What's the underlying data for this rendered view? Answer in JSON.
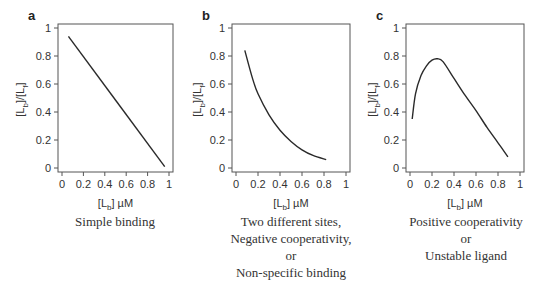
{
  "chart_data": [
    {
      "panel": "a",
      "type": "line",
      "title": "",
      "caption": [
        "Simple binding"
      ],
      "xlabel": "[Lb] µM",
      "ylabel": "[Lb]/[Lf]",
      "xlim": [
        0,
        1
      ],
      "ylim": [
        0,
        1
      ],
      "xticks": [
        "0",
        "0.2",
        "0.4",
        "0.6",
        "0.8",
        "1"
      ],
      "yticks": [
        "0",
        "0.2",
        "0.4",
        "0.6",
        "0.8",
        "1"
      ],
      "grid": false,
      "series": [
        {
          "name": "Simple binding",
          "x": [
            0.06,
            0.96
          ],
          "y": [
            0.94,
            0.01
          ]
        }
      ]
    },
    {
      "panel": "b",
      "type": "line",
      "title": "",
      "caption": [
        "Two different sites,",
        "Negative cooperativity,",
        "or",
        "Non-specific binding"
      ],
      "xlabel": "[Lb] µM",
      "ylabel": "[Lb]/[Lf]",
      "xlim": [
        0,
        1
      ],
      "ylim": [
        0,
        1
      ],
      "xticks": [
        "0",
        "0.2",
        "0.4",
        "0.6",
        "0.8",
        "1"
      ],
      "yticks": [
        "0",
        "0.2",
        "0.4",
        "0.6",
        "0.8",
        "1"
      ],
      "grid": false,
      "series": [
        {
          "name": "Negative cooperativity",
          "x": [
            0.08,
            0.15,
            0.2,
            0.3,
            0.4,
            0.5,
            0.6,
            0.7,
            0.82
          ],
          "y": [
            0.84,
            0.64,
            0.53,
            0.38,
            0.27,
            0.19,
            0.13,
            0.09,
            0.06
          ]
        }
      ]
    },
    {
      "panel": "c",
      "type": "line",
      "title": "",
      "caption": [
        "Positive cooperativity",
        "or",
        "Unstable ligand"
      ],
      "xlabel": "[Lb] µM",
      "ylabel": "[Lb]/[Lf]",
      "xlim": [
        0,
        1
      ],
      "ylim": [
        0,
        1
      ],
      "xticks": [
        "0",
        "0.2",
        "0.4",
        "0.6",
        "0.8",
        "1"
      ],
      "yticks": [
        "0",
        "0.2",
        "0.4",
        "0.6",
        "0.8",
        "1"
      ],
      "grid": false,
      "series": [
        {
          "name": "Positive cooperativity",
          "x": [
            0.02,
            0.05,
            0.1,
            0.15,
            0.2,
            0.25,
            0.3,
            0.4,
            0.5,
            0.6,
            0.7,
            0.8,
            0.89
          ],
          "y": [
            0.35,
            0.53,
            0.66,
            0.73,
            0.77,
            0.78,
            0.76,
            0.64,
            0.52,
            0.41,
            0.29,
            0.18,
            0.08
          ]
        }
      ]
    }
  ],
  "panels": [
    {
      "letter": "a",
      "xlabel_main": "[L",
      "xlabel_sub": "b",
      "xlabel_unit": "] µM",
      "ylabel_a": "[L",
      "ylabel_sub1": "b",
      "ylabel_b": "]/[L",
      "ylabel_sub2": "f",
      "ylabel_c": "]",
      "caption": [
        "Simple binding"
      ]
    },
    {
      "letter": "b",
      "xlabel_main": "[L",
      "xlabel_sub": "b",
      "xlabel_unit": "] µM",
      "ylabel_a": "[L",
      "ylabel_sub1": "b",
      "ylabel_b": "]/[L",
      "ylabel_sub2": "f",
      "ylabel_c": "]",
      "caption": [
        "Two different sites,",
        "Negative cooperativity,",
        "or",
        "Non-specific binding"
      ]
    },
    {
      "letter": "c",
      "xlabel_main": "[L",
      "xlabel_sub": "b",
      "xlabel_unit": "] µM",
      "ylabel_a": "[L",
      "ylabel_sub1": "b",
      "ylabel_b": "]/[L",
      "ylabel_sub2": "f",
      "ylabel_c": "]",
      "caption": [
        "Positive cooperativity",
        "or",
        "Unstable ligand"
      ]
    }
  ],
  "style": {
    "axis_color": "#555555",
    "line_color": "#2a2a2a",
    "text_color": "#333333"
  }
}
